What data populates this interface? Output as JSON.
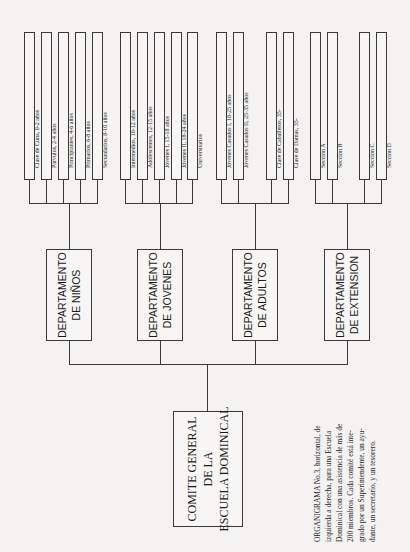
{
  "diagram": {
    "type": "organizational-chart",
    "orientation": "horizontal, rotated 90 degrees",
    "root": {
      "label_lines": [
        "COMITE GENERAL",
        "DE LA",
        "ESCUELA DOMINICAL"
      ]
    },
    "departments": [
      {
        "label_lines": [
          "DEPARTAMENTO",
          "DE NIÑOS"
        ],
        "classes": [
          "Clase de Cuna, 0-2 años",
          "Párvulos, 2-4 años",
          "Principiantes, 4-6 años",
          "Primarios, 6-8 años",
          "Secundarios, 8-10 años"
        ]
      },
      {
        "label_lines": [
          "DEPARTAMENTO",
          "DE JOVENES"
        ],
        "classes": [
          "Intermedios, 10-12 años",
          "Adolescentes, 12-15 años",
          "Jóvenes I, 15-18 años",
          "Jóvenes II, 18-24 años",
          "Universitarios"
        ]
      },
      {
        "label_lines": [
          "DEPARTAMENTO",
          "DE ADULTOS"
        ],
        "classes": [
          "Jóvenes Casados I, 18-25 años",
          "Jóvenes Casados II, 25-35 años",
          "Clase de Caballeros, 35-",
          "Clase de Damas, 35-"
        ]
      },
      {
        "label_lines": [
          "DEPARTAMENTO",
          "DE EXTENSION"
        ],
        "classes": [
          "Sección A",
          "Sección B",
          "Sección C",
          "Sección D"
        ]
      }
    ],
    "caption_lines": [
      "ORGANIGRAMA No.3, horizontal, de",
      "izquierda a derecha, para una Escuela",
      "Dominical con una asistencia de más de",
      "200 miembros. Cada comité está inte-",
      "grado por un Superintendente, un ayu-",
      "dante, un secretario, y un tesorero."
    ]
  }
}
